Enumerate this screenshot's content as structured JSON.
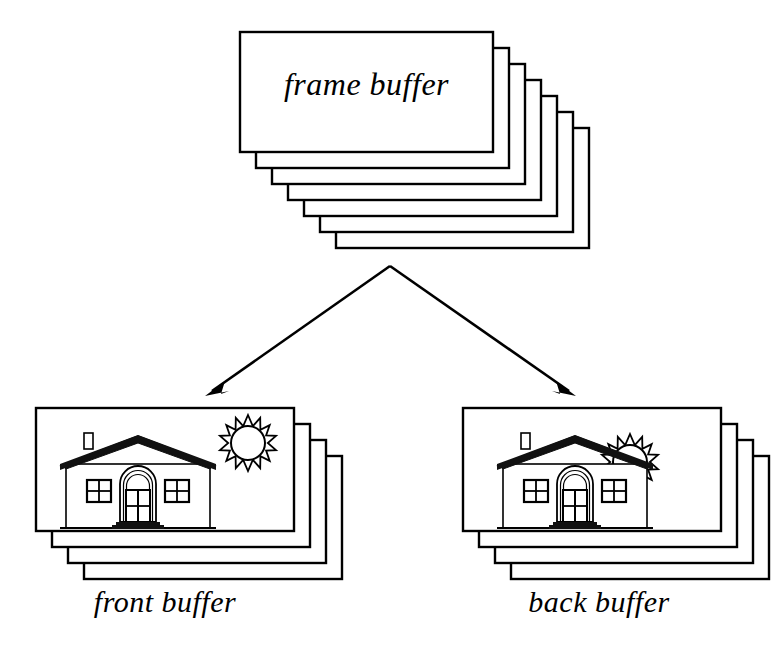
{
  "diagram": {
    "background_color": "#ffffff",
    "stroke_color": "#000000",
    "fill_color": "#ffffff"
  },
  "stacks": {
    "frame_buffer": {
      "label": "frame buffer",
      "card_count": 7,
      "card_width": 253,
      "card_height": 120,
      "front_x": 240,
      "front_y": 32,
      "offset_x": 16,
      "offset_y": 16,
      "has_scene": false
    },
    "front_buffer": {
      "label": "front buffer",
      "card_count": 4,
      "card_width": 258,
      "card_height": 123,
      "front_x": 36,
      "front_y": 408,
      "offset_x": 16,
      "offset_y": 16,
      "has_scene": true,
      "scene": {
        "house_x": 60,
        "house_y": 438,
        "house_scale": 1.0,
        "sun_cx": 248,
        "sun_cy": 443,
        "sun_r": 17,
        "sun_rays": 14,
        "sun_behind_roof": false
      }
    },
    "back_buffer": {
      "label": "back buffer",
      "card_count": 4,
      "card_width": 258,
      "card_height": 123,
      "front_x": 463,
      "front_y": 408,
      "offset_x": 16,
      "offset_y": 16,
      "has_scene": true,
      "scene": {
        "house_x": 497,
        "house_y": 438,
        "house_scale": 1.0,
        "sun_cx": 630,
        "sun_cy": 462,
        "sun_r": 17,
        "sun_rays": 14,
        "sun_behind_roof": true
      }
    }
  },
  "arrows": [
    {
      "name": "arrow-to-front-buffer",
      "from_x": 390,
      "from_y": 266,
      "to_x": 205,
      "to_y": 396
    },
    {
      "name": "arrow-to-back-buffer",
      "from_x": 390,
      "from_y": 266,
      "to_x": 576,
      "to_y": 396
    }
  ],
  "icons": {
    "house": "house-icon",
    "sun": "sun-icon",
    "chimney": "chimney-icon",
    "door": "door-icon",
    "window_left": "window-icon",
    "window_right": "window-icon",
    "steps": "steps-icon",
    "roof": "roof-icon"
  }
}
